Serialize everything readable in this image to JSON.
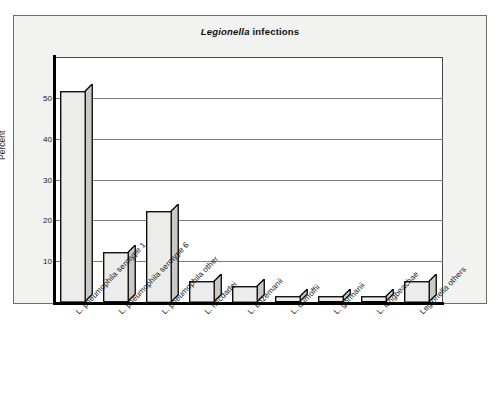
{
  "chart_data": {
    "type": "bar",
    "title": "Legionella infections",
    "title_italic_part": "Legionella",
    "title_plain_part": " infections",
    "xlabel": "",
    "ylabel": "Percent",
    "ylim": [
      0,
      60
    ],
    "yticks": [
      10,
      20,
      30,
      40,
      50
    ],
    "ytick_labels": [
      "10",
      "20",
      "30",
      "40",
      "50"
    ],
    "grid": true,
    "legend": "none",
    "categories": [
      "L. pneumophila serotype 1",
      "L. pneumophila serotype 6",
      "L. pneumophila other",
      "L. micdadei",
      "L. bozemanii",
      "L. dumoffii",
      "L. gormanii",
      "L. longbeachae",
      "Legionella others"
    ],
    "values": [
      51.5,
      12.0,
      22.2,
      5.0,
      3.8,
      1.2,
      1.2,
      1.2,
      5.0
    ],
    "bar_face_color": "#ececeb",
    "bar_side_color": "#c9c9c7",
    "bar_edge_color": "#000000",
    "panel_color": "#f2f2f0",
    "plot_bg_color": "#ffffff",
    "gridline_color": "#7a7a7a",
    "axis_color": "#000000"
  }
}
